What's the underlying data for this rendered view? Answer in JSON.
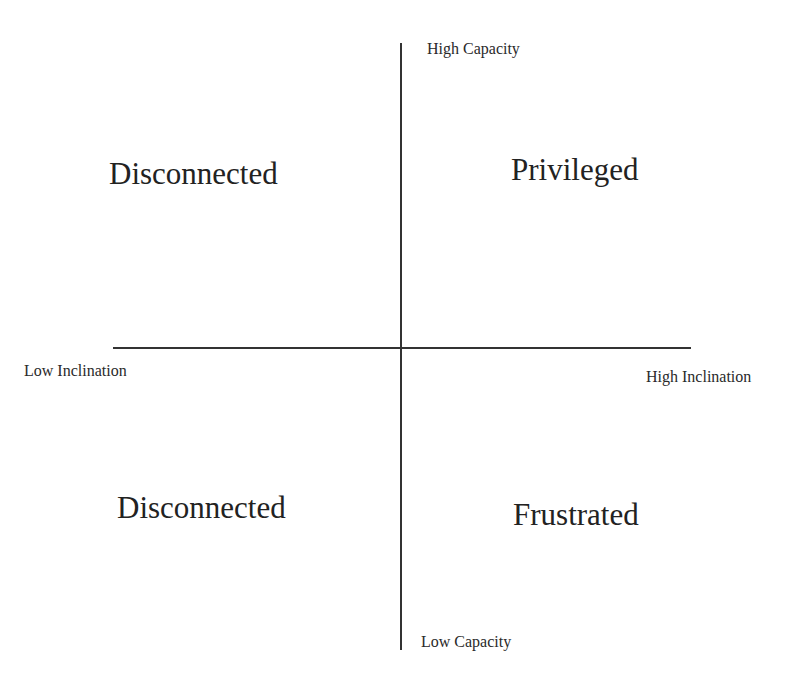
{
  "diagram": {
    "type": "quadrant",
    "axes": {
      "vertical": {
        "top_label": "High Capacity",
        "bottom_label": "Low Capacity"
      },
      "horizontal": {
        "left_label": "Low Inclination",
        "right_label": "High Inclination"
      }
    },
    "quadrants": {
      "top_left": "Disconnected",
      "top_right": "Privileged",
      "bottom_left": "Disconnected",
      "bottom_right": "Frustrated"
    },
    "colors": {
      "background": "#ffffff",
      "line": "#333333",
      "text": "#222222"
    }
  }
}
